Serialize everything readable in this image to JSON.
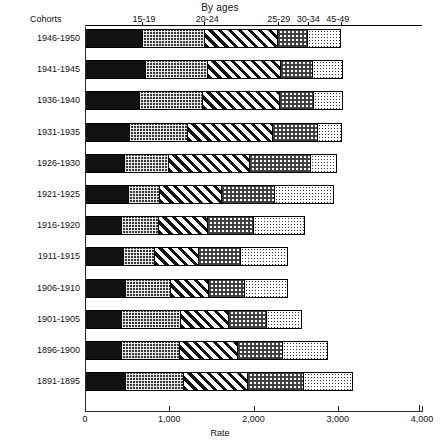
{
  "chart_data": {
    "type": "bar",
    "orientation": "horizontal",
    "stacked": true,
    "title": "By ages",
    "xlabel": "Rate",
    "ylabel": "Cohorts",
    "xlim": [
      0,
      4000
    ],
    "xticks": [
      0,
      1000,
      2000,
      3000,
      4000
    ],
    "xticklabels": [
      "0",
      "1,000",
      "2,000",
      "3,000",
      "4,000"
    ],
    "grid": false,
    "legend": "top-axis-annotations",
    "age_group_labels": [
      {
        "label": "15-19",
        "x": 700
      },
      {
        "label": "20-24",
        "x": 1450
      },
      {
        "label": "25-29",
        "x": 2300
      },
      {
        "label": "30-34",
        "x": 2650
      },
      {
        "label": "45-49",
        "x": 3000
      }
    ],
    "categories": [
      "1946-1950",
      "1941-1945",
      "1936-1940",
      "1931-1935",
      "1926-1930",
      "1921-1925",
      "1916-1920",
      "1911-1915",
      "1906-1910",
      "1901-1905",
      "1896-1900",
      "1891-1895"
    ],
    "series": [
      {
        "name": "15-19",
        "pattern": "solid",
        "values": [
          675,
          700,
          630,
          510,
          450,
          500,
          425,
          440,
          465,
          425,
          415,
          465
        ]
      },
      {
        "name": "20-24",
        "pattern": "grid",
        "values": [
          740,
          745,
          760,
          700,
          535,
          370,
          440,
          370,
          545,
          700,
          700,
          700
        ]
      },
      {
        "name": "25-29",
        "pattern": "diagonal",
        "values": [
          875,
          880,
          925,
          1020,
          960,
          745,
          580,
          535,
          450,
          580,
          690,
          760
        ]
      },
      {
        "name": "30-34",
        "pattern": "checker",
        "values": [
          355,
          380,
          405,
          535,
          735,
          640,
          560,
          500,
          440,
          450,
          545,
          665
        ]
      },
      {
        "name": "45-49",
        "pattern": "dots",
        "values": [
          390,
          355,
          345,
          285,
          310,
          700,
          605,
          560,
          510,
          425,
          535,
          595
        ]
      }
    ],
    "totals": [
      3035,
      3060,
      3065,
      3050,
      2990,
      2955,
      2610,
      2405,
      2410,
      2580,
      2885,
      3185
    ]
  }
}
